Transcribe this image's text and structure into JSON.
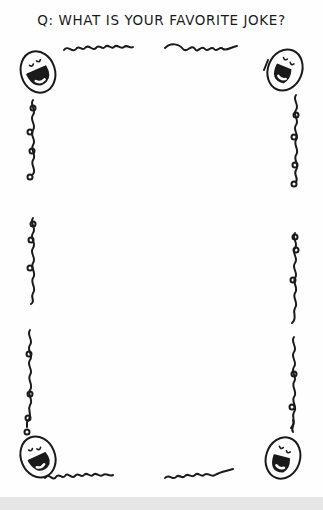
{
  "worksheet": {
    "title": "Q: WHAT IS YOUR FAVORITE JOKE?",
    "frame_style": "hand-drawn curly vine border",
    "corner_icons": [
      "laughing-face-icon",
      "laughing-face-icon",
      "laughing-face-icon",
      "laughing-face-icon"
    ],
    "answer_area": ""
  },
  "colors": {
    "ink": "#1a1a1a",
    "paper": "#fefefe",
    "bottom_band": "#e6e6e6"
  }
}
